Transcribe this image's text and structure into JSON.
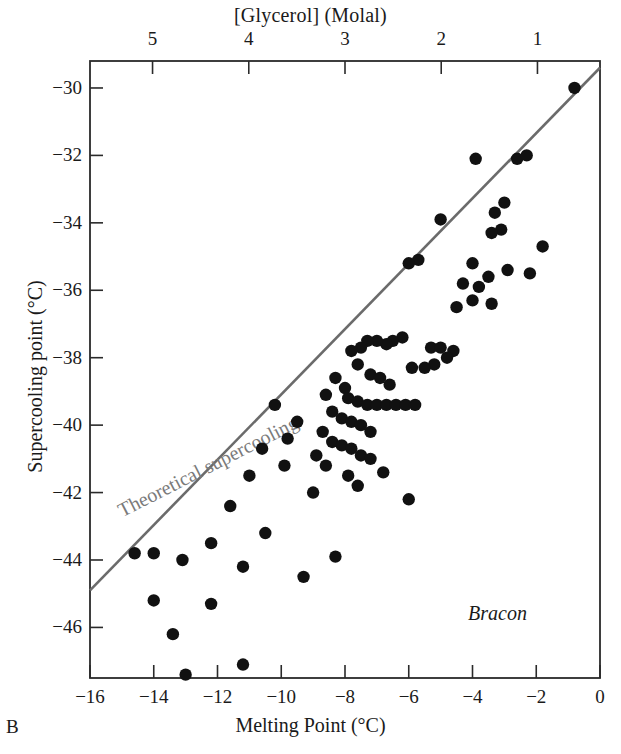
{
  "figure": {
    "panel_label": "B",
    "top_axis_title": "[Glycerol] (Molal)",
    "bottom_axis_title": "Melting Point (°C)",
    "left_axis_title": "Supercooling point (°C)",
    "species_annotation": "Bracon",
    "line_annotation": "Theoretical supercooling",
    "colors": {
      "point": "#111111",
      "line": "#6b6b6b",
      "frame": "#2a2a2a",
      "annotation": "#7a7a7a",
      "background": "#ffffff"
    }
  },
  "axes": {
    "top": {
      "title": "[Glycerol] (Molal)",
      "tick_labels": [
        "5",
        "4",
        "3",
        "2",
        "1"
      ],
      "tick_values": [
        5,
        4,
        3,
        2,
        1
      ],
      "direction": "decreasing-left-to-right"
    },
    "bottom": {
      "title": "Melting Point (°C)",
      "tick_labels": [
        "−16",
        "−14",
        "−12",
        "−10",
        "−8",
        "−6",
        "−4",
        "−2",
        "0"
      ],
      "tick_values": [
        -16,
        -14,
        -12,
        -10,
        -8,
        -6,
        -4,
        -2,
        0
      ],
      "range": [
        -16,
        0
      ]
    },
    "left": {
      "title": "Supercooling point (°C)",
      "tick_labels": [
        "−30",
        "−32",
        "−34",
        "−36",
        "−38",
        "−40",
        "−42",
        "−44",
        "−46"
      ],
      "tick_values": [
        -30,
        -32,
        -34,
        -36,
        -38,
        -40,
        -42,
        -44,
        -46
      ],
      "range": [
        -47.5,
        -29.2
      ]
    }
  },
  "chart_data": {
    "type": "scatter",
    "title": "",
    "subtitle": "",
    "xlabel": "Melting Point (°C)",
    "ylabel": "Supercooling point (°C)",
    "x2label": "[Glycerol] (Molal)",
    "xlim": [
      -16,
      0
    ],
    "ylim": [
      -47.5,
      -29.2
    ],
    "x2lim": [
      5.65,
      0.35
    ],
    "grid": false,
    "legend": false,
    "annotations": [
      {
        "text": "Theoretical supercooling",
        "type": "line-label",
        "x": -12.2,
        "y": -41.4,
        "rotation": -27
      },
      {
        "text": "Bracon",
        "type": "species-label",
        "x": -3.2,
        "y": -46.1,
        "italic": true
      }
    ],
    "series": [
      {
        "name": "Theoretical supercooling",
        "type": "line",
        "color": "#6b6b6b",
        "x": [
          -16.0,
          0.0
        ],
        "y": [
          -44.9,
          -29.4
        ]
      },
      {
        "name": "Bracon supercooling points",
        "type": "scatter",
        "color": "#111111",
        "marker": "filled-circle",
        "points": [
          [
            -0.8,
            -30.0
          ],
          [
            -2.6,
            -32.1
          ],
          [
            -2.3,
            -32.0
          ],
          [
            -3.9,
            -32.1
          ],
          [
            -3.0,
            -33.4
          ],
          [
            -3.3,
            -33.7
          ],
          [
            -3.1,
            -34.2
          ],
          [
            -3.4,
            -34.3
          ],
          [
            -5.0,
            -33.9
          ],
          [
            -1.8,
            -34.7
          ],
          [
            -4.0,
            -35.2
          ],
          [
            -2.2,
            -35.5
          ],
          [
            -2.9,
            -35.4
          ],
          [
            -3.5,
            -35.6
          ],
          [
            -3.8,
            -35.9
          ],
          [
            -4.3,
            -35.8
          ],
          [
            -4.0,
            -36.3
          ],
          [
            -3.4,
            -36.4
          ],
          [
            -4.5,
            -36.5
          ],
          [
            -5.7,
            -35.1
          ],
          [
            -6.0,
            -35.2
          ],
          [
            -5.3,
            -37.7
          ],
          [
            -5.0,
            -37.7
          ],
          [
            -4.6,
            -37.8
          ],
          [
            -4.8,
            -38.0
          ],
          [
            -5.2,
            -38.2
          ],
          [
            -5.5,
            -38.3
          ],
          [
            -5.9,
            -38.3
          ],
          [
            -6.2,
            -37.4
          ],
          [
            -6.5,
            -37.5
          ],
          [
            -6.7,
            -37.6
          ],
          [
            -7.0,
            -37.5
          ],
          [
            -7.3,
            -37.5
          ],
          [
            -7.5,
            -37.7
          ],
          [
            -7.8,
            -37.8
          ],
          [
            -7.6,
            -38.2
          ],
          [
            -7.2,
            -38.5
          ],
          [
            -6.9,
            -38.6
          ],
          [
            -6.6,
            -38.8
          ],
          [
            -8.3,
            -38.6
          ],
          [
            -8.0,
            -38.9
          ],
          [
            -7.9,
            -39.2
          ],
          [
            -7.6,
            -39.3
          ],
          [
            -7.3,
            -39.4
          ],
          [
            -7.0,
            -39.4
          ],
          [
            -6.7,
            -39.4
          ],
          [
            -6.4,
            -39.4
          ],
          [
            -6.1,
            -39.4
          ],
          [
            -5.8,
            -39.4
          ],
          [
            -8.6,
            -39.1
          ],
          [
            -8.4,
            -39.6
          ],
          [
            -8.1,
            -39.8
          ],
          [
            -7.8,
            -39.9
          ],
          [
            -7.5,
            -40.0
          ],
          [
            -7.2,
            -40.2
          ],
          [
            -8.7,
            -40.2
          ],
          [
            -8.4,
            -40.5
          ],
          [
            -8.1,
            -40.6
          ],
          [
            -7.8,
            -40.7
          ],
          [
            -7.5,
            -40.9
          ],
          [
            -7.2,
            -41.0
          ],
          [
            -8.9,
            -40.9
          ],
          [
            -8.6,
            -41.2
          ],
          [
            -7.9,
            -41.5
          ],
          [
            -7.6,
            -41.8
          ],
          [
            -6.0,
            -42.2
          ],
          [
            -6.8,
            -41.4
          ],
          [
            -9.5,
            -39.9
          ],
          [
            -10.2,
            -39.4
          ],
          [
            -9.8,
            -40.4
          ],
          [
            -10.6,
            -40.7
          ],
          [
            -9.9,
            -41.2
          ],
          [
            -11.0,
            -41.5
          ],
          [
            -9.0,
            -42.0
          ],
          [
            -11.6,
            -42.4
          ],
          [
            -10.5,
            -43.2
          ],
          [
            -12.2,
            -43.5
          ],
          [
            -11.2,
            -44.2
          ],
          [
            -13.1,
            -44.0
          ],
          [
            -14.0,
            -43.8
          ],
          [
            -14.6,
            -43.8
          ],
          [
            -13.4,
            -46.2
          ],
          [
            -12.2,
            -45.3
          ],
          [
            -11.2,
            -47.1
          ],
          [
            -13.0,
            -47.4
          ],
          [
            -14.0,
            -45.2
          ],
          [
            -9.3,
            -44.5
          ],
          [
            -8.3,
            -43.9
          ]
        ]
      }
    ]
  }
}
